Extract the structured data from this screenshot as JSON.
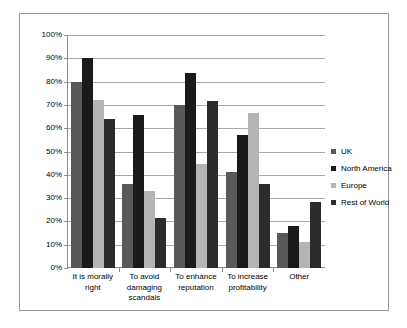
{
  "chart_data": {
    "type": "bar",
    "title": "",
    "subtitle": "",
    "xlabel": "",
    "ylabel": "",
    "ylim": [
      0,
      100
    ],
    "y_tick_labels": [
      "0%",
      "10%",
      "20%",
      "30%",
      "40%",
      "50%",
      "60%",
      "70%",
      "80%",
      "90%",
      "100%"
    ],
    "y_tick_values": [
      0,
      10,
      20,
      30,
      40,
      50,
      60,
      70,
      80,
      90,
      100
    ],
    "grid": "horizontal",
    "legend_position": "right",
    "categories": [
      "It is morally right",
      "To avoid damaging scandals",
      "To enhance reputation",
      "To increase profitability",
      "Other"
    ],
    "category_lines": [
      [
        "It is morally",
        "right"
      ],
      [
        "To avoid",
        "damaging",
        "scandals"
      ],
      [
        "To enhance",
        "reputation"
      ],
      [
        "To increase",
        "profitability"
      ],
      [
        "Other"
      ]
    ],
    "series": [
      {
        "name": "UK",
        "color": "#595959",
        "values": [
          80,
          36,
          70,
          41,
          15
        ]
      },
      {
        "name": "North America",
        "color": "#1a1a1a",
        "values": [
          90,
          65.5,
          83.5,
          57,
          18
        ]
      },
      {
        "name": "Europe",
        "color": "#b5b5b5",
        "values": [
          72,
          33,
          44.5,
          66.5,
          11
        ]
      },
      {
        "name": "Rest of World",
        "color": "#2b2b2b",
        "values": [
          64,
          21.5,
          71.5,
          36,
          28.5
        ]
      }
    ]
  },
  "frame": {
    "border_color": "#9a9a9a",
    "background": "#ffffff"
  }
}
